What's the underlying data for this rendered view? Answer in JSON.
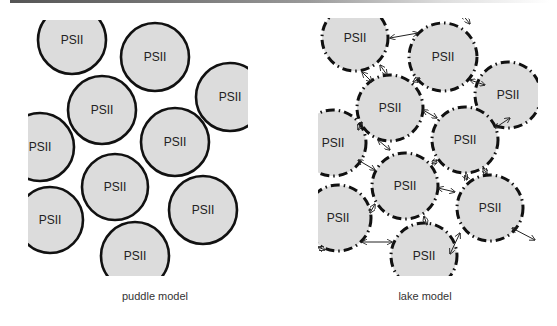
{
  "figure": {
    "panels": [
      {
        "id": "puddle",
        "caption": "puddle model",
        "border_style": "solid",
        "circle_fill": "#dcdcdc",
        "circle_stroke": "#111111",
        "clip": {
          "x": 28,
          "y": 20,
          "width": 220,
          "height": 256
        },
        "circles": [
          {
            "label": "PSII",
            "cx": 72,
            "cy": 40,
            "r": 34
          },
          {
            "label": "PSII",
            "cx": 155,
            "cy": 57,
            "r": 34
          },
          {
            "label": "PSII",
            "cx": 102,
            "cy": 110,
            "r": 34
          },
          {
            "label": "PSII",
            "cx": 230,
            "cy": 97,
            "r": 34
          },
          {
            "label": "PSII",
            "cx": 175,
            "cy": 142,
            "r": 34
          },
          {
            "label": "PSII",
            "cx": 40,
            "cy": 147,
            "r": 34
          },
          {
            "label": "PSII",
            "cx": 115,
            "cy": 187,
            "r": 33
          },
          {
            "label": "PSII",
            "cx": 203,
            "cy": 210,
            "r": 34
          },
          {
            "label": "PSII",
            "cx": 50,
            "cy": 220,
            "r": 33
          },
          {
            "label": "PSII",
            "cx": 135,
            "cy": 256,
            "r": 34
          }
        ]
      },
      {
        "id": "lake",
        "caption": "lake model",
        "border_style": "dash-dot",
        "circle_fill": "#dcdcdc",
        "circle_stroke": "#111111",
        "clip": {
          "x": 318,
          "y": 18,
          "width": 220,
          "height": 258
        },
        "circles": [
          {
            "label": "PSII",
            "cx": 355,
            "cy": 38,
            "r": 33
          },
          {
            "label": "PSII",
            "cx": 443,
            "cy": 57,
            "r": 34
          },
          {
            "label": "PSII",
            "cx": 390,
            "cy": 108,
            "r": 33
          },
          {
            "label": "PSII",
            "cx": 508,
            "cy": 95,
            "r": 33
          },
          {
            "label": "PSII",
            "cx": 465,
            "cy": 140,
            "r": 33
          },
          {
            "label": "PSII",
            "cx": 333,
            "cy": 143,
            "r": 33
          },
          {
            "label": "PSII",
            "cx": 405,
            "cy": 186,
            "r": 33
          },
          {
            "label": "PSII",
            "cx": 490,
            "cy": 208,
            "r": 33
          },
          {
            "label": "PSII",
            "cx": 338,
            "cy": 218,
            "r": 33
          },
          {
            "label": "PSII",
            "cx": 424,
            "cy": 256,
            "r": 33
          }
        ],
        "arrows": [
          {
            "x1": 390,
            "y1": 38,
            "x2": 418,
            "y2": 33
          },
          {
            "x1": 470,
            "y1": 24,
            "x2": 462,
            "y2": 14
          },
          {
            "x1": 380,
            "y1": 65,
            "x2": 387,
            "y2": 75
          },
          {
            "x1": 362,
            "y1": 72,
            "x2": 372,
            "y2": 82
          },
          {
            "x1": 413,
            "y1": 82,
            "x2": 420,
            "y2": 78
          },
          {
            "x1": 470,
            "y1": 80,
            "x2": 485,
            "y2": 85
          },
          {
            "x1": 423,
            "y1": 110,
            "x2": 437,
            "y2": 118
          },
          {
            "x1": 495,
            "y1": 128,
            "x2": 510,
            "y2": 118
          },
          {
            "x1": 358,
            "y1": 130,
            "x2": 362,
            "y2": 122
          },
          {
            "x1": 358,
            "y1": 160,
            "x2": 375,
            "y2": 170
          },
          {
            "x1": 378,
            "y1": 140,
            "x2": 390,
            "y2": 150
          },
          {
            "x1": 432,
            "y1": 164,
            "x2": 437,
            "y2": 160
          },
          {
            "x1": 483,
            "y1": 168,
            "x2": 487,
            "y2": 174
          },
          {
            "x1": 465,
            "y1": 175,
            "x2": 467,
            "y2": 180
          },
          {
            "x1": 438,
            "y1": 188,
            "x2": 455,
            "y2": 192
          },
          {
            "x1": 370,
            "y1": 213,
            "x2": 375,
            "y2": 204
          },
          {
            "x1": 424,
            "y1": 216,
            "x2": 427,
            "y2": 225
          },
          {
            "x1": 362,
            "y1": 242,
            "x2": 392,
            "y2": 242
          },
          {
            "x1": 318,
            "y1": 247,
            "x2": 325,
            "y2": 250
          },
          {
            "x1": 460,
            "y1": 233,
            "x2": 450,
            "y2": 254
          },
          {
            "x1": 512,
            "y1": 228,
            "x2": 535,
            "y2": 240
          }
        ]
      }
    ]
  }
}
